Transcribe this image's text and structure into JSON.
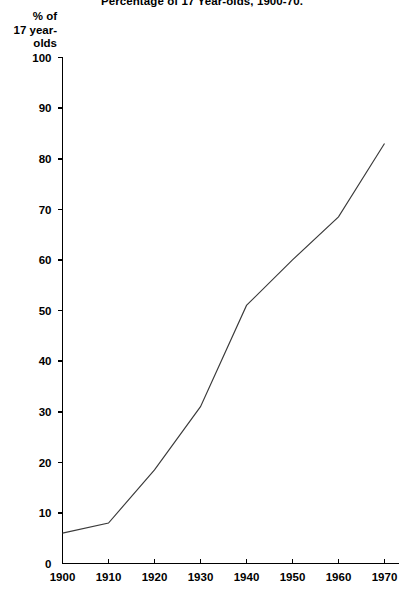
{
  "chart_data": {
    "type": "line",
    "title": "Percentage of 17 Year-olds, 1900-70.",
    "ylabel_lines": [
      "% of",
      "17 year-",
      "olds"
    ],
    "xlabel": "",
    "x": [
      1900,
      1910,
      1920,
      1930,
      1940,
      1950,
      1960,
      1970
    ],
    "categories": [
      "1900",
      "1910",
      "1920",
      "1930",
      "1940",
      "1950",
      "1960",
      "1970"
    ],
    "values": [
      6,
      8,
      18.5,
      31,
      51,
      60,
      68.5,
      83
    ],
    "series": [
      {
        "name": "Percentage of 17 year-olds",
        "values": [
          6,
          8,
          18.5,
          31,
          51,
          60,
          68.5,
          83
        ]
      }
    ],
    "ylim": [
      0,
      100
    ],
    "xlim": [
      1900,
      1970
    ],
    "ytick_labels": [
      "0",
      "10",
      "20",
      "30",
      "40",
      "50",
      "60",
      "70",
      "80",
      "90",
      "100"
    ],
    "ytick_values": [
      0,
      10,
      20,
      30,
      40,
      50,
      60,
      70,
      80,
      90,
      100
    ],
    "xtick_labels": [
      "1900",
      "1910",
      "1920",
      "1930",
      "1940",
      "1950",
      "1960",
      "1970"
    ],
    "xtick_values": [
      1900,
      1910,
      1920,
      1930,
      1940,
      1950,
      1960,
      1970
    ],
    "grid": false,
    "legend": "none",
    "line_color": "#3a3a3a",
    "axis_color": "#000000",
    "background_color": "#ffffff"
  }
}
